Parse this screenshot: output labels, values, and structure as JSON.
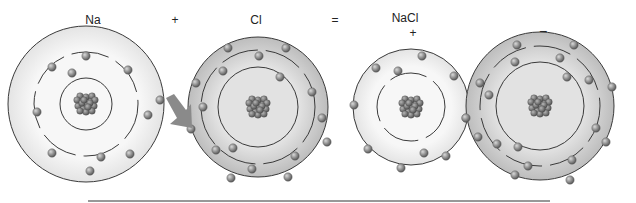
{
  "equation": {
    "reactant1": "Na",
    "plus": "+",
    "reactant2": "Cl",
    "equals": "=",
    "product": "NaCl",
    "cation_charge": "+",
    "anion_charge": "−"
  },
  "atoms": [
    {
      "id": "sodium-atom",
      "label": "Na",
      "cx": 86,
      "cy": 104,
      "shells": [
        26,
        52,
        78
      ],
      "shaded": false,
      "electrons": [
        [
          86,
          56
        ],
        [
          52,
          67
        ],
        [
          72,
          73
        ],
        [
          128,
          70
        ],
        [
          37,
          112
        ],
        [
          148,
          115
        ],
        [
          52,
          153
        ],
        [
          101,
          157
        ],
        [
          130,
          154
        ],
        [
          90,
          171
        ],
        [
          160,
          100
        ]
      ]
    },
    {
      "id": "chlorine-atom",
      "label": "Cl",
      "cx": 258,
      "cy": 107,
      "shells": [
        40,
        57,
        70
      ],
      "shaded": true,
      "electrons": [
        [
          228,
          48
        ],
        [
          286,
          48
        ],
        [
          259,
          56
        ],
        [
          223,
          71
        ],
        [
          280,
          77
        ],
        [
          196,
          83
        ],
        [
          203,
          107
        ],
        [
          312,
          92
        ],
        [
          322,
          118
        ],
        [
          191,
          129
        ],
        [
          216,
          150
        ],
        [
          233,
          148
        ],
        [
          295,
          156
        ],
        [
          327,
          142
        ],
        [
          252,
          169
        ],
        [
          231,
          178
        ],
        [
          288,
          177
        ]
      ]
    },
    {
      "id": "sodium-ion",
      "label": "Na+",
      "cx": 411,
      "cy": 107,
      "shells": [
        34,
        58
      ],
      "shaded": false,
      "electrons": [
        [
          422,
          56
        ],
        [
          376,
          68
        ],
        [
          398,
          71
        ],
        [
          454,
          76
        ],
        [
          354,
          105
        ],
        [
          466,
          118
        ],
        [
          368,
          149
        ],
        [
          424,
          153
        ],
        [
          446,
          156
        ],
        [
          401,
          168
        ]
      ]
    },
    {
      "id": "chloride-ion",
      "label": "Cl−",
      "cx": 540,
      "cy": 106,
      "shells": [
        44,
        60,
        74
      ],
      "shaded": true,
      "electrons": [
        [
          517,
          45
        ],
        [
          574,
          45
        ],
        [
          560,
          58
        ],
        [
          515,
          62
        ],
        [
          567,
          77
        ],
        [
          589,
          80
        ],
        [
          612,
          87
        ],
        [
          480,
          83
        ],
        [
          489,
          95
        ],
        [
          596,
          128
        ],
        [
          606,
          142
        ],
        [
          478,
          137
        ],
        [
          497,
          144
        ],
        [
          518,
          147
        ],
        [
          528,
          166
        ],
        [
          572,
          160
        ],
        [
          515,
          175
        ],
        [
          570,
          180
        ],
        [
          466,
          118
        ]
      ]
    }
  ],
  "transfer_arrow": {
    "from": [
      166,
      102
    ],
    "to": [
      190,
      126
    ],
    "color": "#8a8a8a"
  },
  "colors": {
    "shell_line": "#3a3a3a",
    "electron": "#8c8c8c",
    "nucleus": "#707070",
    "shade_outer": "#c9c9c9",
    "shade_inner": "#e8e8e8",
    "baseline": "#333333"
  },
  "baseline": {
    "x1": 88,
    "x2": 550,
    "y": 201
  }
}
